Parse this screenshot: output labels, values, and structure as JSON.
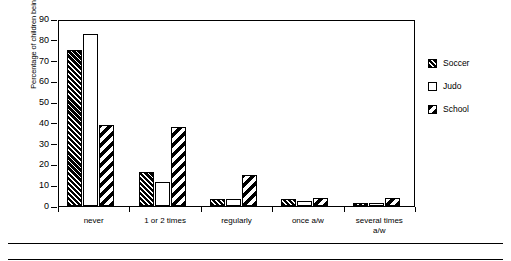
{
  "chart": {
    "type": "bar",
    "title": "",
    "xlabel": "",
    "ylabel": "Percentage of children being bullied",
    "ylim": [
      0,
      90
    ],
    "ytick_step": 10,
    "grid": false,
    "legend_position": "right"
  },
  "chart_data": {
    "type": "bar",
    "title": "",
    "xlabel": "",
    "ylabel": "Percentage of children being bullied",
    "ylim": [
      0,
      90
    ],
    "yticks": [
      0,
      10,
      20,
      30,
      40,
      50,
      60,
      70,
      80,
      90
    ],
    "ytick_labels": [
      "0",
      "10",
      "20",
      "30",
      "40",
      "50",
      "60",
      "70",
      "80",
      "90"
    ],
    "categories": [
      "never",
      "1 or 2 times",
      "regularly",
      "once a/w",
      "several times a/w"
    ],
    "series": [
      {
        "name": "Soccer",
        "pattern": "dense-diagonal-hatch",
        "values": [
          75,
          16.5,
          3.5,
          3.5,
          1.5
        ]
      },
      {
        "name": "Judo",
        "pattern": "solid-white",
        "values": [
          83,
          11.5,
          3.5,
          2.5,
          1.5
        ]
      },
      {
        "name": "School",
        "pattern": "wide-diagonal-stripe",
        "values": [
          39,
          38,
          15,
          4,
          4
        ]
      }
    ],
    "grid": false,
    "legend_position": "right",
    "colors": {
      "outline": "#000000",
      "fill": "#ffffff",
      "hatch": "#000000",
      "shadow": "#9a9a9a",
      "background": "#ffffff"
    }
  },
  "axis": {
    "y_title": "Percentage of children being bullied",
    "y_ticks": [
      "90",
      "80",
      "70",
      "60",
      "50",
      "40",
      "30",
      "20",
      "10",
      "0"
    ],
    "x_categories": [
      "never",
      "1 or 2 times",
      "regularly",
      "once a/w",
      "several times\na/w"
    ]
  },
  "legend": {
    "items": [
      {
        "label": "Soccer"
      },
      {
        "label": "Judo"
      },
      {
        "label": "School"
      }
    ]
  }
}
